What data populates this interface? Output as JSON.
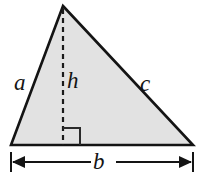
{
  "figure": {
    "background_color": "#ffffff",
    "fill_color": "#e2e2e2",
    "stroke_color": "#141414",
    "labels": {
      "side_a": "a",
      "side_c": "c",
      "height_h": "h",
      "base_b": "b"
    },
    "icons": {
      "right_angle": "right-angle-marker",
      "height_line": "dashed-height-line",
      "dimension_line": "double-arrow-dimension-line"
    },
    "geometry": {
      "apex": [
        63,
        6
      ],
      "bottom_left": [
        11,
        145
      ],
      "bottom_right": [
        193,
        145
      ],
      "foot_of_height": [
        63,
        145
      ],
      "right_angle_square": [
        63,
        127,
        17,
        17
      ],
      "dimension_line_y": 162,
      "dimension_left_x": 11,
      "dimension_right_x": 193
    }
  }
}
